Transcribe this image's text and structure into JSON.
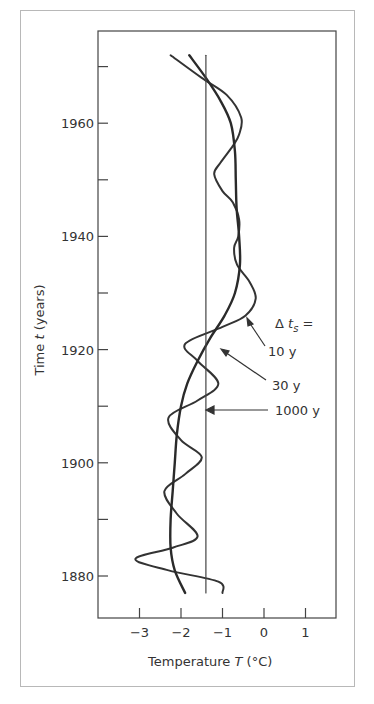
{
  "chart_data": {
    "type": "line",
    "orientation": "vertical-time",
    "title": "",
    "xlabel": "Temperature T (°C)",
    "ylabel": "Time t (years)",
    "xlim": [
      -3.9,
      1.75
    ],
    "ylim": [
      1872,
      1977
    ],
    "x_ticks": [
      -3,
      -2,
      -1,
      0,
      1
    ],
    "x_tick_labels": [
      "−3",
      "−2",
      "−1",
      "0",
      "1"
    ],
    "y_ticks": [
      1880,
      1890,
      1900,
      1910,
      1920,
      1930,
      1940,
      1950,
      1960,
      1970
    ],
    "y_tick_labels": [
      "1880",
      "",
      "1900",
      "",
      "1920",
      "",
      "1940",
      "",
      "1960",
      ""
    ],
    "grid": false,
    "legend_title": "Δ t_s =",
    "series": [
      {
        "name": "10 y",
        "points": [
          [
            1972,
            -2.25
          ],
          [
            1968,
            -1.5
          ],
          [
            1965,
            -0.9
          ],
          [
            1961,
            -0.55
          ],
          [
            1958,
            -0.6
          ],
          [
            1956,
            -0.75
          ],
          [
            1953,
            -1.05
          ],
          [
            1951,
            -1.2
          ],
          [
            1948,
            -1.0
          ],
          [
            1946,
            -0.75
          ],
          [
            1943,
            -0.6
          ],
          [
            1940,
            -0.62
          ],
          [
            1938,
            -0.72
          ],
          [
            1935,
            -0.65
          ],
          [
            1932,
            -0.35
          ],
          [
            1929,
            -0.2
          ],
          [
            1926,
            -0.45
          ],
          [
            1924,
            -1.0
          ],
          [
            1921,
            -1.9
          ],
          [
            1918,
            -1.6
          ],
          [
            1914,
            -1.1
          ],
          [
            1911,
            -1.6
          ],
          [
            1908,
            -2.3
          ],
          [
            1904,
            -2.0
          ],
          [
            1901,
            -1.5
          ],
          [
            1898,
            -1.9
          ],
          [
            1895,
            -2.4
          ],
          [
            1891,
            -2.1
          ],
          [
            1887,
            -1.6
          ],
          [
            1885,
            -2.2
          ],
          [
            1883,
            -3.1
          ],
          [
            1881,
            -2.3
          ],
          [
            1879,
            -1.1
          ],
          [
            1877,
            -1.0
          ]
        ]
      },
      {
        "name": "30 y",
        "points": [
          [
            1972,
            -1.8
          ],
          [
            1968,
            -1.4
          ],
          [
            1964,
            -1.05
          ],
          [
            1960,
            -0.8
          ],
          [
            1955,
            -0.7
          ],
          [
            1950,
            -0.68
          ],
          [
            1945,
            -0.66
          ],
          [
            1940,
            -0.6
          ],
          [
            1935,
            -0.58
          ],
          [
            1930,
            -0.7
          ],
          [
            1926,
            -0.95
          ],
          [
            1922,
            -1.3
          ],
          [
            1918,
            -1.6
          ],
          [
            1914,
            -1.85
          ],
          [
            1910,
            -2.0
          ],
          [
            1905,
            -2.1
          ],
          [
            1900,
            -2.15
          ],
          [
            1895,
            -2.2
          ],
          [
            1890,
            -2.25
          ],
          [
            1885,
            -2.25
          ],
          [
            1881,
            -2.15
          ],
          [
            1877,
            -1.9
          ]
        ]
      },
      {
        "name": "1000 y",
        "points": [
          [
            1972,
            -1.4
          ],
          [
            1877,
            -1.4
          ]
        ]
      }
    ],
    "annotations": [
      {
        "text": "Δ t_s =",
        "type": "legend-heading"
      },
      {
        "text": "10 y",
        "arrow_to_series": "10 y"
      },
      {
        "text": "30 y",
        "arrow_to_series": "30 y"
      },
      {
        "text": "1000 y",
        "arrow_to_series": "1000 y"
      }
    ]
  },
  "labels": {
    "y_axis_title_main": "Time ",
    "y_axis_title_var": "t",
    "y_axis_title_unit": " (years)",
    "x_axis_title_main": "Temperature ",
    "x_axis_title_var": "T",
    "x_axis_title_unit": " (°C)",
    "legend_heading_delta": "Δ ",
    "legend_heading_var": "t",
    "legend_heading_sub": "s",
    "legend_heading_eq": " =",
    "label_10y": "10  y",
    "label_30y": "30  y",
    "label_1000y": "1000  y"
  }
}
